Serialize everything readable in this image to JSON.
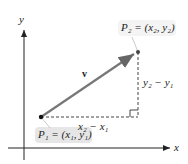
{
  "diagram": {
    "axes": {
      "x_label": "x",
      "y_label": "y"
    },
    "vector": {
      "label": "v",
      "color": "#7a7a7a"
    },
    "points": {
      "p1": {
        "label": "P₁ = (x₁, y₁)"
      },
      "p2": {
        "label": "P₂ = (x₂, y₂)"
      }
    },
    "differences": {
      "horizontal": "x₂ − x₁",
      "vertical": "y₂ − y₁"
    }
  }
}
